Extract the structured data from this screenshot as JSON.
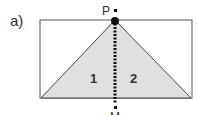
{
  "figure": {
    "panel_label": "a)",
    "point_top_label": "P",
    "point_bottom_label": "M",
    "region_left_label": "1",
    "region_right_label": "2"
  },
  "colors": {
    "fill": "#e0e0e0",
    "stroke": "#333333",
    "dot": "#1a1a1a"
  }
}
